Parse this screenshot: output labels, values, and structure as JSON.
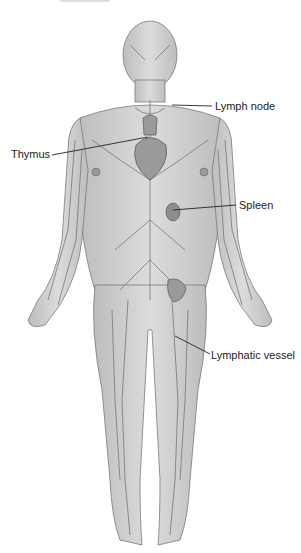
{
  "diagram": {
    "labels": {
      "lymph_node": "Lymph node",
      "thymus": "Thymus",
      "spleen": "Spleen",
      "lymphatic_vessel": "Lymphatic vessel"
    },
    "colors": {
      "body_fill": "#d4d4d4",
      "body_shade": "#b8b8b8",
      "vessel": "#6a6a6a",
      "organ": "#8c8c8c",
      "line": "#222222"
    }
  }
}
